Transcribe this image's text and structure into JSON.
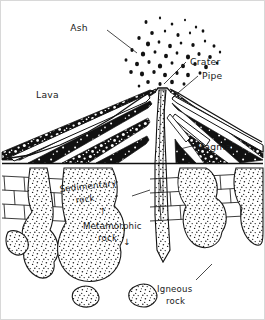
{
  "diagram": {
    "background_color": "#ffffff",
    "ink_color": "#1a1a1a",
    "frame_color": "#d8d8d8",
    "width": 265,
    "height": 320
  },
  "labels": {
    "ash": "Ash",
    "crater": "Crater",
    "pipe": "Pipe",
    "lava": "Lava",
    "magma": "Magma",
    "sedimentary_line1": "Sedimentary",
    "sedimentary_line2": "rock",
    "metamorphic_line1": "Metamorphic",
    "metamorphic_line2": "rock",
    "igneous_line1": "Igneous",
    "igneous_line2": "rock"
  },
  "arrows": {
    "up_arrow": "↑",
    "down_arrow": "↓"
  },
  "layers": [
    {
      "name": "ash-cloud",
      "description": "scattered dark particles above crater"
    },
    {
      "name": "volcano-cone",
      "description": "alternating dark tephra and white lava beds"
    },
    {
      "name": "ground-line",
      "description": "horizontal surface datum"
    },
    {
      "name": "sedimentary-rock",
      "description": "brick-pattern strata"
    },
    {
      "name": "metamorphic-rock",
      "description": "contact zone around intrusions"
    },
    {
      "name": "igneous-rock",
      "description": "stippled intrusive bodies"
    }
  ]
}
